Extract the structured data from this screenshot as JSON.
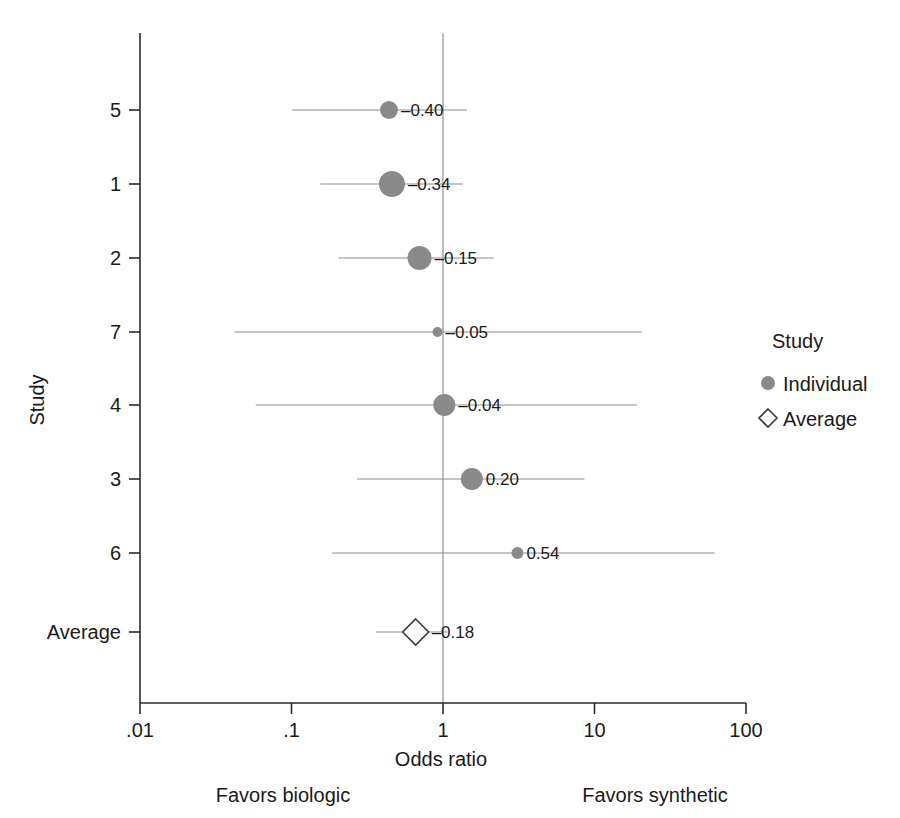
{
  "chart_data": {
    "type": "scatter",
    "plot_kind": "forest-plot",
    "title": "",
    "xlabel": "Odds ratio",
    "ylabel": "Study",
    "xscale": "log",
    "xlim": [
      0.01,
      100
    ],
    "xticks": [
      0.01,
      0.1,
      1,
      10,
      100
    ],
    "xticklabels": [
      ".01",
      ".1",
      "1",
      "10",
      "100"
    ],
    "reference_line": 1,
    "grid": false,
    "categories": [
      "5",
      "1",
      "2",
      "7",
      "4",
      "3",
      "6",
      "Average"
    ],
    "value_labels": [
      "–0.40",
      "–0.34",
      "–0.15",
      "–0.05",
      "–0.04",
      "0.20",
      "0.54",
      "–0.18"
    ],
    "rows": [
      {
        "study": "5",
        "label": "–0.40",
        "effect": 0.44,
        "ci_low": 0.101,
        "ci_high": 1.44,
        "marker": "circle",
        "marker_size": 9,
        "y": 110
      },
      {
        "study": "1",
        "label": "–0.34",
        "effect": 0.46,
        "ci_low": 0.155,
        "ci_high": 1.35,
        "marker": "circle",
        "marker_size": 13,
        "y": 184
      },
      {
        "study": "2",
        "label": "–0.15",
        "effect": 0.7,
        "ci_low": 0.205,
        "ci_high": 2.15,
        "marker": "circle",
        "marker_size": 12,
        "y": 258
      },
      {
        "study": "7",
        "label": "–0.05",
        "effect": 0.92,
        "ci_low": 0.042,
        "ci_high": 20.5,
        "marker": "circle",
        "marker_size": 5,
        "y": 332
      },
      {
        "study": "4",
        "label": "–0.04",
        "effect": 1.02,
        "ci_low": 0.058,
        "ci_high": 19.0,
        "marker": "circle",
        "marker_size": 11,
        "y": 405
      },
      {
        "study": "3",
        "label": "0.20",
        "effect": 1.55,
        "ci_low": 0.27,
        "ci_high": 8.6,
        "marker": "circle",
        "marker_size": 11,
        "y": 479
      },
      {
        "study": "6",
        "label": "0.54",
        "effect": 3.1,
        "ci_low": 0.185,
        "ci_high": 62.0,
        "marker": "circle",
        "marker_size": 6,
        "y": 553
      },
      {
        "study": "Average",
        "label": "–0.18",
        "effect": 0.66,
        "ci_low": 0.36,
        "ci_high": 1.07,
        "marker": "diamond",
        "marker_size": 13,
        "y": 632
      }
    ],
    "legend": {
      "position": "right",
      "title": "Study",
      "entries": [
        {
          "label": "Individual",
          "marker": "circle",
          "color": "#8a8a8a"
        },
        {
          "label": "Average",
          "marker": "diamond",
          "color": "#ffffff"
        }
      ]
    },
    "annotations": [
      {
        "text": "Favors biologic",
        "side": "left"
      },
      {
        "text": "Favors synthetic",
        "side": "right"
      }
    ],
    "colors": {
      "individual_marker": "#8a8a8a",
      "average_marker_fill": "#ffffff",
      "average_marker_stroke": "#3a3a3a",
      "ci_line": "#8d8d8d",
      "axis": "#2b2b2b",
      "reference_line": "#9a9a9a",
      "background": "#ffffff"
    }
  }
}
